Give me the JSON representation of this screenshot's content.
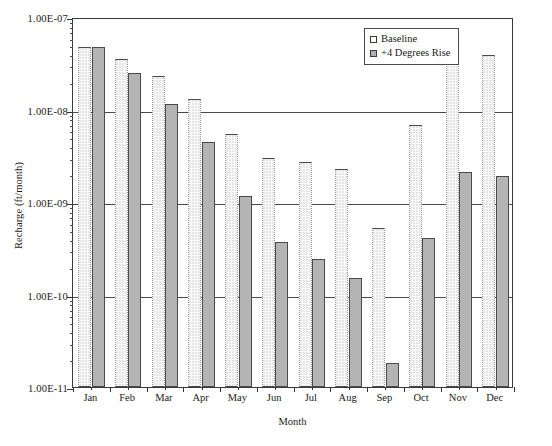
{
  "chart_data": {
    "type": "bar",
    "title": "",
    "xlabel": "Month",
    "ylabel": "Recharge (ft/month)",
    "yscale": "log",
    "ylim": [
      1e-11,
      1e-07
    ],
    "ytick_labels": [
      "1.00E-07",
      "1.00E-08",
      "1.00E-09",
      "1.00E-10",
      "1.00E-11"
    ],
    "ytick_values": [
      1e-07,
      1e-08,
      1e-09,
      1e-10,
      1e-11
    ],
    "grid": true,
    "legend_position": "top-right",
    "categories": [
      "Jan",
      "Feb",
      "Mar",
      "Apr",
      "May",
      "Jun",
      "Jul",
      "Aug",
      "Sep",
      "Oct",
      "Nov",
      "Dec"
    ],
    "series": [
      {
        "name": "Baseline",
        "color": "#fbfbfb",
        "values": [
          4.7e-08,
          3.5e-08,
          2.3e-08,
          1.3e-08,
          5.5e-09,
          3e-09,
          2.7e-09,
          2.3e-09,
          5.2e-10,
          6.8e-09,
          3.3e-08,
          3.9e-08
        ]
      },
      {
        "name": "+4 Degrees Rise",
        "color": "#b4b4b4",
        "values": [
          4.7e-08,
          2.5e-08,
          1.15e-08,
          4.4e-09,
          1.15e-09,
          3.7e-10,
          2.4e-10,
          1.5e-10,
          1.8e-11,
          4.1e-10,
          2.1e-09,
          1.9e-09
        ]
      }
    ]
  },
  "legend": {
    "items": [
      {
        "label": "Baseline",
        "swatch": "baseline-swatch"
      },
      {
        "label": "+4 Degrees Rise",
        "swatch": "rise-swatch"
      }
    ]
  }
}
